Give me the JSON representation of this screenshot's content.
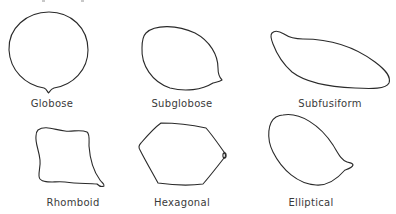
{
  "figure": {
    "shapes": [
      {
        "id": "globose",
        "label": "Globose",
        "row": 1,
        "col": 1
      },
      {
        "id": "subglobose",
        "label": "Subglobose",
        "row": 1,
        "col": 2
      },
      {
        "id": "subfusiform",
        "label": "Subfusiform",
        "row": 1,
        "col": 3
      },
      {
        "id": "rhomboid",
        "label": "Rhomboid",
        "row": 2,
        "col": 1
      },
      {
        "id": "hexagonal",
        "label": "Hexagonal",
        "row": 2,
        "col": 2
      },
      {
        "id": "elliptical",
        "label": "Elliptical",
        "row": 2,
        "col": 3
      }
    ],
    "stroke_color": "#2a2a2a",
    "label_color": "#3a3a3a",
    "background": "#ffffff"
  }
}
